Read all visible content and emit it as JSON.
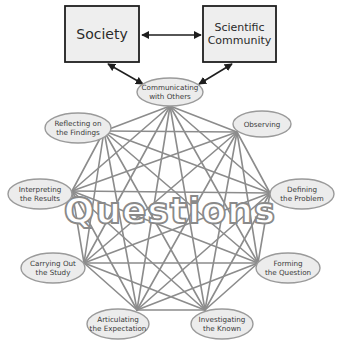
{
  "diagram": {
    "type": "process-network",
    "center_label": "Questions",
    "boxes": [
      {
        "id": "society",
        "lines": [
          "Society"
        ]
      },
      {
        "id": "scientific-community",
        "lines": [
          "Scientific",
          "Community"
        ]
      }
    ],
    "hub_node": {
      "id": "communicating",
      "lines": [
        "Communicating",
        "with Others"
      ]
    },
    "nodes": [
      {
        "id": "communicating",
        "lines": [
          "Communicating",
          "with Others"
        ]
      },
      {
        "id": "observing",
        "lines": [
          "Observing"
        ]
      },
      {
        "id": "defining",
        "lines": [
          "Defining",
          "the Problem"
        ]
      },
      {
        "id": "forming",
        "lines": [
          "Forming",
          "the Question"
        ]
      },
      {
        "id": "investigating",
        "lines": [
          "Investigating",
          "the Known"
        ]
      },
      {
        "id": "articulating",
        "lines": [
          "Articulating",
          "the Expectation"
        ]
      },
      {
        "id": "carrying-out",
        "lines": [
          "Carrying Out",
          "the Study"
        ]
      },
      {
        "id": "interpreting",
        "lines": [
          "Interpreting",
          "the Results"
        ]
      },
      {
        "id": "reflecting",
        "lines": [
          "Reflecting on",
          "the Findings"
        ]
      }
    ],
    "arrows": [
      {
        "from": "society",
        "to": "scientific-community",
        "bidirectional": true
      },
      {
        "from": "society",
        "to": "communicating",
        "bidirectional": true
      },
      {
        "from": "scientific-community",
        "to": "communicating",
        "bidirectional": true
      }
    ],
    "connectivity": "complete-graph",
    "colors": {
      "edge": "#8c8c8c",
      "node_fill": "#ececec",
      "node_stroke": "#9a9a9a",
      "box_fill": "#eeeeee",
      "box_stroke": "#1e1e1e",
      "arrow": "#1e1e1e"
    }
  }
}
